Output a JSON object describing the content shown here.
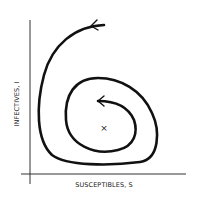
{
  "diagram": {
    "type": "phase-plane spiral",
    "x_axis_label": "SUSCEPTIBLES, S",
    "y_axis_label": "INFECTIVES, I",
    "equilibrium_marker": "×",
    "stroke_color": "#111111",
    "background": "#ffffff"
  }
}
